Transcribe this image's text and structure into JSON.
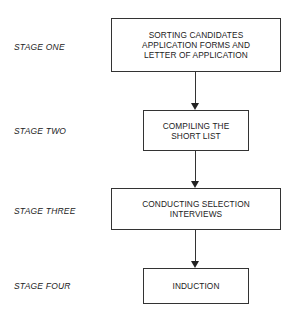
{
  "stages": [
    {
      "label": "STAGE ONE",
      "lines": [
        "SORTING CANDIDATES",
        "APPLICATION FORMS AND",
        "LETTER OF APPLICATION"
      ]
    },
    {
      "label": "STAGE TWO",
      "lines": [
        "COMPILING THE",
        "SHORT LIST"
      ]
    },
    {
      "label": "STAGE THREE",
      "lines": [
        "CONDUCTING SELECTION",
        "INTERVIEWS"
      ]
    },
    {
      "label": "STAGE FOUR",
      "lines": [
        "INDUCTION"
      ]
    }
  ]
}
